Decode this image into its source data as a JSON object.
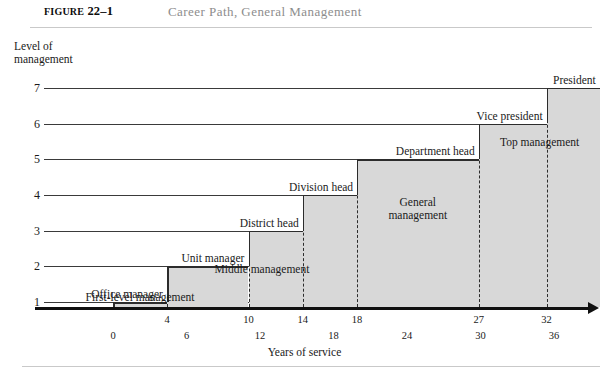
{
  "header": {
    "figure_label_small": "FIGURE",
    "figure_number": "22–1",
    "title": "Career Path, General Management"
  },
  "axes": {
    "y_title": "Level of\nmanagement",
    "x_title": "Years of service",
    "y_ticks": [
      "7",
      "6",
      "5",
      "4",
      "3",
      "2",
      "1"
    ],
    "x_ticks_upper": [
      "4",
      "10",
      "14",
      "18",
      "27",
      "32"
    ],
    "x_ticks_lower": [
      "0",
      "6",
      "12",
      "18",
      "24",
      "30",
      "36"
    ]
  },
  "steps": [
    {
      "label": "Office manager",
      "level": 1,
      "start_year": 0,
      "end_year": 4
    },
    {
      "label": "Unit manager",
      "level": 2,
      "start_year": 4,
      "end_year": 10
    },
    {
      "label": "District head",
      "level": 3,
      "start_year": 10,
      "end_year": 14
    },
    {
      "label": "Division head",
      "level": 4,
      "start_year": 14,
      "end_year": 18
    },
    {
      "label": "Department head",
      "level": 5,
      "start_year": 18,
      "end_year": 27
    },
    {
      "label": "Vice president",
      "level": 6,
      "start_year": 27,
      "end_year": 32
    },
    {
      "label": "President",
      "level": 7,
      "start_year": 32,
      "end_year": 36
    }
  ],
  "bands": [
    {
      "label": "First-level management",
      "from_year": 0,
      "to_year": 4
    },
    {
      "label": "Middle management",
      "from_year": 4,
      "to_year": 18
    },
    {
      "label": "General\nmanagement",
      "from_year": 18,
      "to_year": 27
    },
    {
      "label": "Top management",
      "from_year": 27,
      "to_year": 36
    }
  ],
  "colors": {
    "shade": "#d8d8d8",
    "line": "#2c2c2c",
    "axis": "#101010",
    "title_gray": "#8d8d8d"
  },
  "chart_data": {
    "type": "line",
    "title": "Career Path, General Management",
    "xlabel": "Years of service",
    "ylabel": "Level of management",
    "xlim": [
      0,
      36
    ],
    "ylim": [
      0,
      7
    ],
    "grid": true,
    "legend": "none",
    "series": [
      {
        "name": "Career path",
        "points": [
          {
            "x": 0,
            "y": 1,
            "label": "Office manager"
          },
          {
            "x": 4,
            "y": 1,
            "label": "Office manager"
          },
          {
            "x": 4,
            "y": 2,
            "label": "Unit manager"
          },
          {
            "x": 10,
            "y": 2,
            "label": "Unit manager"
          },
          {
            "x": 10,
            "y": 3,
            "label": "District head"
          },
          {
            "x": 14,
            "y": 3,
            "label": "District head"
          },
          {
            "x": 14,
            "y": 4,
            "label": "Division head"
          },
          {
            "x": 18,
            "y": 4,
            "label": "Division head"
          },
          {
            "x": 18,
            "y": 5,
            "label": "Department head"
          },
          {
            "x": 27,
            "y": 5,
            "label": "Department head"
          },
          {
            "x": 27,
            "y": 6,
            "label": "Vice president"
          },
          {
            "x": 32,
            "y": 6,
            "label": "Vice president"
          },
          {
            "x": 32,
            "y": 7,
            "label": "President"
          },
          {
            "x": 36,
            "y": 7,
            "label": "President"
          }
        ]
      }
    ],
    "annotations": [
      {
        "text": "First-level management",
        "x_range": [
          0,
          4
        ],
        "y": 0.6
      },
      {
        "text": "Middle management",
        "x_range": [
          4,
          18
        ],
        "y": 1.3
      },
      {
        "text": "General management",
        "x_range": [
          18,
          27
        ],
        "y": 3.0
      },
      {
        "text": "Top management",
        "x_range": [
          27,
          36
        ],
        "y": 5.4
      }
    ]
  }
}
